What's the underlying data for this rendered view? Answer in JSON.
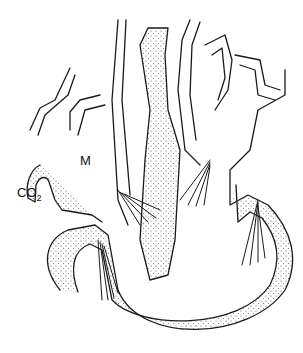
{
  "diagram": {
    "labels": {
      "m": "M",
      "co2_main": "CO",
      "co2_sub": "2"
    },
    "colors": {
      "stroke": "#1a1a1a",
      "stipple": "#555555",
      "background": "#ffffff"
    }
  }
}
